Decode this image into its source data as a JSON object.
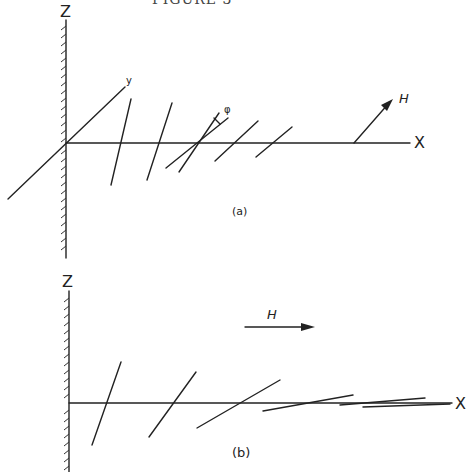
{
  "figure": {
    "top_caption_partial": "FIGURE 3",
    "panel_a": {
      "caption": "(a)",
      "axes": {
        "vertical": "Z",
        "horizontal": "X",
        "depth": "y"
      },
      "field_label": "H",
      "angle_label": "φ"
    },
    "panel_b": {
      "caption": "(b)",
      "axes": {
        "vertical": "Z",
        "horizontal": "X"
      },
      "field_label": "H"
    }
  }
}
